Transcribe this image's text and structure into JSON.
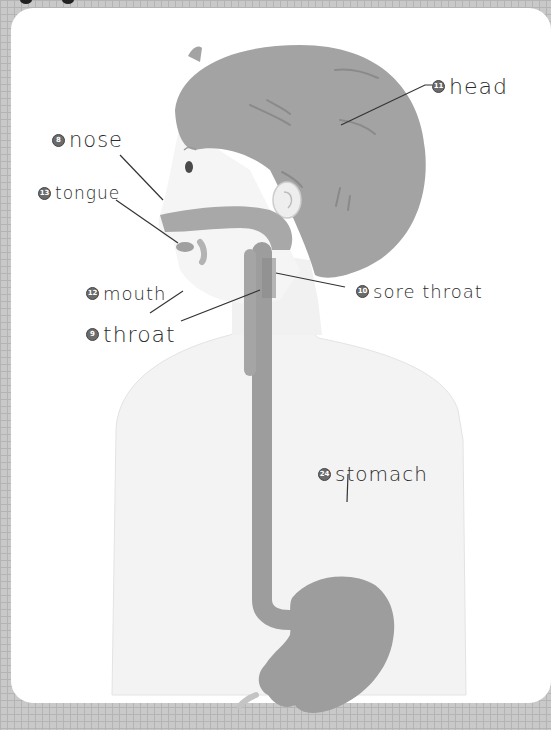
{
  "diagram": {
    "type": "anatomy-illustration",
    "colors": {
      "background_grid": "#c9c9c9",
      "card": "#ffffff",
      "organ_fill": "#9d9d9d",
      "hair_fill": "#a3a3a3",
      "skin_fill": "#f3f3f3",
      "text": "#2b2b2b"
    },
    "labels": [
      {
        "id": "head",
        "number": "11",
        "text": "head"
      },
      {
        "id": "nose",
        "number": "8",
        "text": "nose"
      },
      {
        "id": "tongue",
        "number": "13",
        "text": "tongue"
      },
      {
        "id": "mouth",
        "number": "12",
        "text": "mouth"
      },
      {
        "id": "sore-throat",
        "number": "10",
        "text": "sore throat"
      },
      {
        "id": "throat",
        "number": "9",
        "text": "throat"
      },
      {
        "id": "stomach",
        "number": "24",
        "text": "stomach"
      }
    ]
  }
}
